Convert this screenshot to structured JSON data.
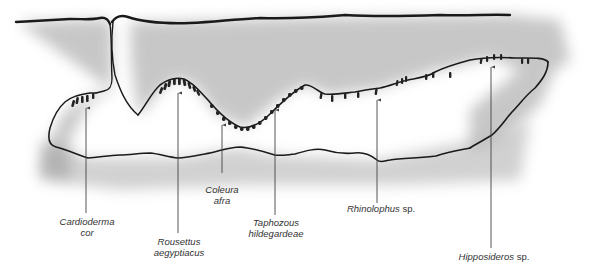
{
  "figure": {
    "type": "cave cross-section illustration",
    "colors": {
      "background": "#ffffff",
      "outline": "#1a1a1a",
      "stipple": "#8a8a8a",
      "roosting_bats": "#222222",
      "label_text": "#333333",
      "pointer_lines": "#444444"
    }
  },
  "species_labels": [
    {
      "id": "cardioderma",
      "line1_genus": "Cardioderma",
      "line1_rest": "",
      "line2": "cor"
    },
    {
      "id": "rousettus",
      "line1_genus": "Rousettus",
      "line1_rest": "",
      "line2": "aegyptiacus"
    },
    {
      "id": "coleura",
      "line1_genus": "Coleura",
      "line1_rest": "",
      "line2": "afra"
    },
    {
      "id": "taphozous",
      "line1_genus": "Taphozous",
      "line1_rest": "",
      "line2": "hildegardeae"
    },
    {
      "id": "rhinolophus",
      "line1_genus": "Rhinolophus",
      "line1_rest": " sp.",
      "line2": ""
    },
    {
      "id": "hipposideros",
      "line1_genus": "Hipposideros",
      "line1_rest": " sp.",
      "line2": ""
    }
  ]
}
